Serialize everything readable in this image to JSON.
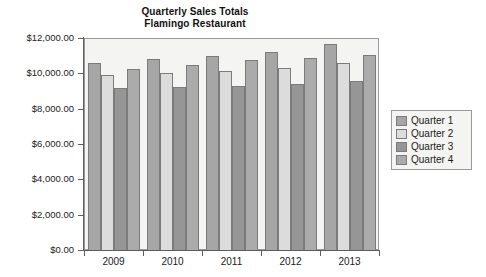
{
  "chart_data": {
    "type": "bar",
    "title": "Quarterly Sales Totals",
    "subtitle": "Flamingo Restaurant",
    "title_lines": [
      "Quarterly Sales Totals",
      "Flamingo Restaurant"
    ],
    "xlabel": "",
    "ylabel": "",
    "categories": [
      "2009",
      "2010",
      "2011",
      "2012",
      "2013"
    ],
    "series": [
      {
        "name": "Quarter 1",
        "color": "#a6a6a6",
        "values": [
          10600,
          10800,
          11000,
          11200,
          11650
        ]
      },
      {
        "name": "Quarter 2",
        "color": "#dcdcdc",
        "values": [
          9900,
          10000,
          10150,
          10300,
          10600
        ]
      },
      {
        "name": "Quarter 3",
        "color": "#969696",
        "values": [
          9150,
          9250,
          9300,
          9400,
          9550
        ]
      },
      {
        "name": "Quarter 4",
        "color": "#ababab",
        "values": [
          10250,
          10450,
          10750,
          10850,
          11050
        ]
      }
    ],
    "ylim": [
      0,
      12000
    ],
    "ytick_values": [
      0,
      2000,
      4000,
      6000,
      8000,
      10000,
      12000
    ],
    "ytick_labels": [
      "$0.00",
      "$2,000.00",
      "$4,000.00",
      "$6,000.00",
      "$8,000.00",
      "$10,000.00",
      "$12,000.00"
    ],
    "grid": false,
    "legend_position": "right",
    "legend_entries": [
      "Quarter 1",
      "Quarter 2",
      "Quarter 3",
      "Quarter 4"
    ],
    "plot_background": "#f4f4f2",
    "axis_color": "#5d5d5d"
  }
}
